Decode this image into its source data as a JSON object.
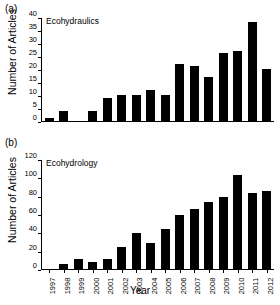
{
  "figure": {
    "xlabel": "Year",
    "ylabel": "Number of Articles",
    "panels": [
      {
        "letter": "(a)",
        "label": "Ecohydraulics"
      },
      {
        "letter": "(b)",
        "label": "Ecohydrology"
      }
    ]
  },
  "chart_data": [
    {
      "type": "bar",
      "title": "Ecohydraulics",
      "panel": "(a)",
      "xlabel": "Year",
      "ylabel": "Number of Articles",
      "categories": [
        "1997",
        "1998",
        "1999",
        "2000",
        "2001",
        "2002",
        "2003",
        "2004",
        "2005",
        "2006",
        "2007",
        "2008",
        "2009",
        "2010",
        "2011",
        "2012"
      ],
      "values": [
        1,
        4,
        0,
        4,
        9,
        10,
        10,
        12,
        10,
        22,
        21,
        17,
        26,
        27,
        38,
        20
      ],
      "ylim": [
        0,
        40
      ],
      "yticks": [
        0,
        5,
        10,
        15,
        20,
        25,
        30,
        35,
        40
      ],
      "grid": false,
      "legend": "none",
      "bar_color": "#000000"
    },
    {
      "type": "bar",
      "title": "Ecohydrology",
      "panel": "(b)",
      "xlabel": "Year",
      "ylabel": "Number of Articles",
      "categories": [
        "1997",
        "1998",
        "1999",
        "2000",
        "2001",
        "2002",
        "2003",
        "2004",
        "2005",
        "2006",
        "2007",
        "2008",
        "2009",
        "2010",
        "2011",
        "2012"
      ],
      "values": [
        0,
        6,
        11,
        8,
        11,
        24,
        39,
        28,
        44,
        59,
        66,
        73,
        79,
        103,
        83,
        85
      ],
      "ylim": [
        0,
        120
      ],
      "yticks": [
        0,
        20,
        40,
        60,
        80,
        100,
        120
      ],
      "grid": false,
      "legend": "none",
      "bar_color": "#000000"
    }
  ]
}
